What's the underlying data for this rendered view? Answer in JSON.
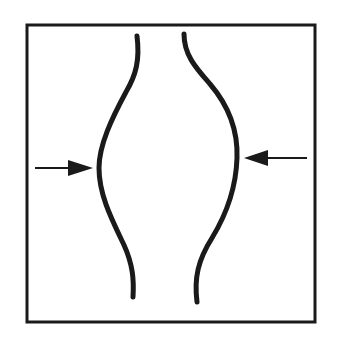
{
  "diagram": {
    "background": "#ffffff",
    "stroke_color": "#1a1a1a",
    "frame": {
      "x": 27,
      "y": 25,
      "width": 288,
      "height": 297
    },
    "curves": [
      {
        "name": "left-curve",
        "path": "M137,36 C140,60 136,75 126,92 C112,118 99,145 99,168 C99,195 112,220 124,245 C133,265 134,280 133,297"
      },
      {
        "name": "right-curve",
        "path": "M184,34 C184,55 196,68 210,84 C228,105 238,130 237,158 C236,190 226,215 212,238 C198,260 194,278 197,302"
      }
    ],
    "arrows": [
      {
        "name": "left-arrow",
        "direction": "right",
        "line": {
          "x1": 35,
          "y1": 168,
          "x2": 68,
          "y2": 168
        },
        "head": "68,160 93,168 68,176"
      },
      {
        "name": "right-arrow",
        "direction": "left",
        "line": {
          "x1": 307,
          "y1": 158,
          "x2": 268,
          "y2": 158
        },
        "head": "268,150 244,158 268,166"
      }
    ]
  }
}
